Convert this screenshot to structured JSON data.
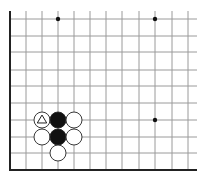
{
  "diagram": {
    "type": "go-board-fragment",
    "corner": "bottom-left",
    "grid": {
      "columns_x": [
        10,
        26,
        42,
        58,
        74,
        90,
        106,
        122,
        139,
        155,
        172,
        188
      ],
      "rows_y": [
        19,
        36,
        52,
        70,
        86,
        103,
        120,
        137,
        153,
        170
      ],
      "top_extent": 11,
      "right_extent": 197,
      "left_edge_x": 10,
      "bottom_edge_y": 170,
      "line_color": "#9a9a9a",
      "edge_color": "#222222"
    },
    "star_points": [
      {
        "x": 58,
        "y": 19
      },
      {
        "x": 155,
        "y": 19
      },
      {
        "x": 155,
        "y": 120
      }
    ],
    "stones": [
      {
        "x": 42,
        "y": 120,
        "color": "white",
        "marker": "triangle"
      },
      {
        "x": 58,
        "y": 120,
        "color": "black"
      },
      {
        "x": 74,
        "y": 120,
        "color": "white"
      },
      {
        "x": 42,
        "y": 137,
        "color": "white"
      },
      {
        "x": 58,
        "y": 137,
        "color": "black"
      },
      {
        "x": 74,
        "y": 137,
        "color": "white"
      },
      {
        "x": 58,
        "y": 153,
        "color": "white"
      }
    ],
    "stone_radius": 8
  }
}
